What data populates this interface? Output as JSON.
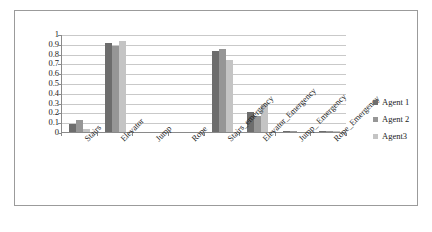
{
  "chart_data": {
    "type": "bar",
    "title": "",
    "xlabel": "",
    "ylabel": "",
    "ylim": [
      0,
      1
    ],
    "ytick_labels": [
      "1",
      "0.9",
      "0.8",
      "0.7",
      "0.6",
      "0.5",
      "0.4",
      "0.3",
      "0.2",
      "0.1",
      "0"
    ],
    "ytick_values": [
      1,
      0.9,
      0.8,
      0.7,
      0.6,
      0.5,
      0.4,
      0.3,
      0.2,
      0.1,
      0
    ],
    "grid": true,
    "legend_position": "right",
    "categories": [
      "Stairs",
      "Elevator",
      "Jump",
      "Rope",
      "Stairs_emergency",
      "Elevator_Emergency",
      "Jump_ Emergency",
      "Rope_Emergency"
    ],
    "series": [
      {
        "name": "Agent 1",
        "color": "#6d6d6d",
        "values": [
          0.08,
          0.91,
          0,
          0,
          0.83,
          0.2,
          0.01,
          0.01
        ]
      },
      {
        "name": "Agent 2",
        "color": "#969696",
        "values": [
          0.12,
          0.88,
          0,
          0,
          0.85,
          0.16,
          0.01,
          0.01
        ]
      },
      {
        "name": "Agent3",
        "color": "#c4c4c4",
        "values": [
          0.03,
          0.93,
          0,
          0,
          0.73,
          0.29,
          0.0,
          0.01
        ]
      }
    ]
  },
  "legend": {
    "items": [
      {
        "label": "Agent 1"
      },
      {
        "label": "Agent 2"
      },
      {
        "label": "Agent3"
      }
    ]
  }
}
